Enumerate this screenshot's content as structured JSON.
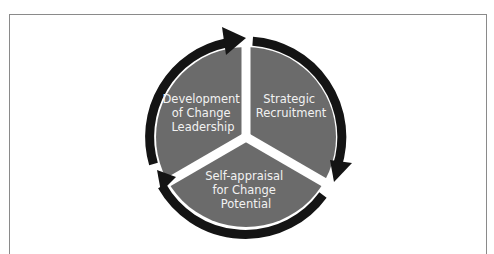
{
  "diagram": {
    "type": "cycle",
    "direction": "clockwise",
    "colors": {
      "segment_fill": "#6b6b6b",
      "ring_arrow": "#141414",
      "separator": "#ffffff",
      "label_text": "#f2f2f2",
      "frame_border": "#8a8a8a"
    },
    "segments": [
      {
        "id": "development",
        "lines": [
          "Development",
          "of Change",
          "Leadership"
        ]
      },
      {
        "id": "recruitment",
        "lines": [
          "Strategic",
          "Recruitment"
        ]
      },
      {
        "id": "self-appraisal",
        "lines": [
          "Self-appraisal",
          "for Change",
          "Potential"
        ]
      }
    ]
  }
}
